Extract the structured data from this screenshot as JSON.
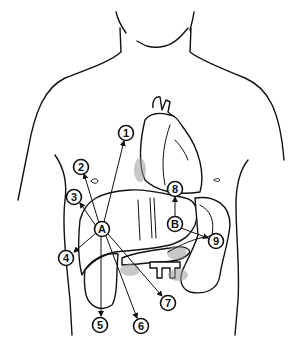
{
  "diagram": {
    "line_color": "#111111",
    "background": "#ffffff",
    "callouts": [
      {
        "id": "c1",
        "label": "1"
      },
      {
        "id": "c2",
        "label": "2"
      },
      {
        "id": "c3",
        "label": "3"
      },
      {
        "id": "c4",
        "label": "4"
      },
      {
        "id": "c5",
        "label": "5"
      },
      {
        "id": "c6",
        "label": "6"
      },
      {
        "id": "c7",
        "label": "7"
      },
      {
        "id": "c8",
        "label": "8"
      },
      {
        "id": "c9",
        "label": "9"
      },
      {
        "id": "cA",
        "label": "A"
      },
      {
        "id": "cB",
        "label": "B"
      }
    ],
    "hubs": {
      "A": {
        "connects_to": [
          "1",
          "2",
          "3",
          "4",
          "5",
          "6",
          "7"
        ]
      },
      "B": {
        "connects_to": [
          "8",
          "9"
        ]
      }
    }
  }
}
